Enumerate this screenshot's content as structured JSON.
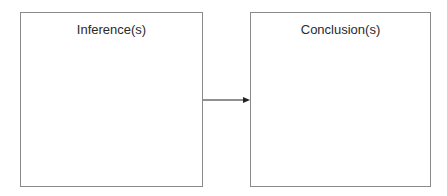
{
  "diagram": {
    "nodes": [
      {
        "id": "inferences",
        "label": "Inference(s)"
      },
      {
        "id": "conclusions",
        "label": "Conclusion(s)"
      }
    ],
    "edges": [
      {
        "from": "inferences",
        "to": "conclusions",
        "type": "arrow"
      }
    ],
    "colors": {
      "border": "#8a8a8a",
      "arrow": "#222222",
      "text": "#2a2a2a"
    }
  }
}
